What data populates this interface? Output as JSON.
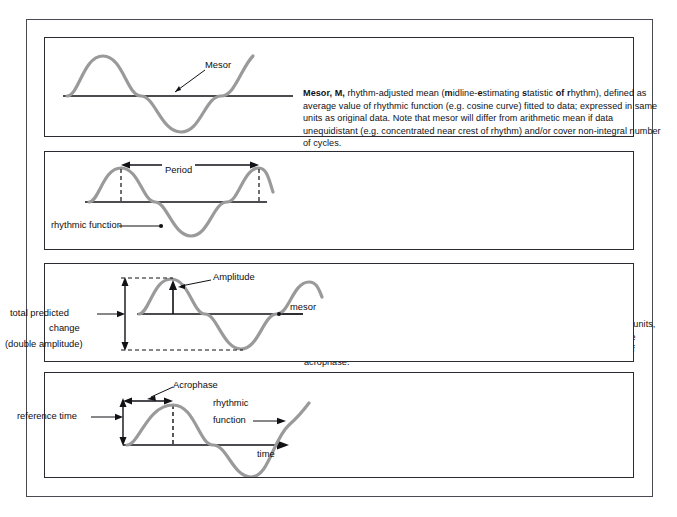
{
  "figure": {
    "colors": {
      "wave": "#9a9a9a",
      "axis": "#111116",
      "panel_border": "#2a2a30",
      "outer_border": "#4a4a52",
      "text": "#111116",
      "background": "#ffffff"
    }
  },
  "panels": [
    {
      "id": "mesor",
      "term": "Mesor, M,",
      "diagram_labels": [
        {
          "name": "mesor-callout",
          "text": "Mesor"
        }
      ],
      "text_runs": [
        {
          "bold": true,
          "text": "Mesor, M,"
        },
        {
          "bold": false,
          "text": " rhythm-adjusted mean ("
        },
        {
          "bold": true,
          "text": "m"
        },
        {
          "bold": false,
          "text": "idline-"
        },
        {
          "bold": true,
          "text": "e"
        },
        {
          "bold": false,
          "text": "stimating "
        },
        {
          "bold": true,
          "text": "s"
        },
        {
          "bold": false,
          "text": "tatistic "
        },
        {
          "bold": true,
          "text": "of"
        },
        {
          "bold": false,
          "text": " "
        },
        {
          "bold": true,
          "text": "r"
        },
        {
          "bold": false,
          "text": "hythm), defined as average value of rhythmic function (e.g. cosine curve) fitted to data; expressed in same units as original data. Note that mesor will differ from arithmetic mean if data unequidistant (e.g. concentrated near crest of rhythm) and/or cover non-integral number of cycles."
        }
      ]
    },
    {
      "id": "period",
      "term": "Period, τ,",
      "diagram_labels": [
        {
          "name": "period-callout",
          "text": "Period"
        },
        {
          "name": "rhythmic-function-callout",
          "text": "rhythmic function"
        }
      ],
      "text_runs": [
        {
          "bold": true,
          "text": "Period,"
        },
        {
          "bold": false,
          "text": " "
        },
        {
          "bold": true,
          "text": "τ,"
        },
        {
          "bold": false,
          "text": " duration of one complete cycle in rhythmic function; expressed in time units, such as seconds, hours, days or years, or in physiological units such as complete cardiac, respiratory or menstrual cycles; equated to 360°for angular expression of acrophase."
        }
      ]
    },
    {
      "id": "amplitude",
      "term": "Amplitude, A,",
      "diagram_labels": [
        {
          "name": "amplitude-callout",
          "text": "Amplitude"
        },
        {
          "name": "total-predicted-change-label-line1",
          "text": "total predicted"
        },
        {
          "name": "total-predicted-change-label-line2",
          "text": "change"
        },
        {
          "name": "double-amplitude-label",
          "text": "(double amplitude)"
        },
        {
          "name": "mesor-callout",
          "text": "mesor"
        }
      ],
      "text_runs": [
        {
          "bold": true,
          "text": "Amplitude, A,"
        },
        {
          "bold": false,
          "text": " half of total predictable change in rhythm, defined by rhythmic function fitted to data; expressed in original or ‘relative’ units, e.g. as percentage of series mean or mesor."
        }
      ]
    },
    {
      "id": "acrophase",
      "term": "Acrophase, ø,",
      "diagram_labels": [
        {
          "name": "acrophase-callout",
          "text": "Acrophase"
        },
        {
          "name": "reference-time-label",
          "text": "reference time"
        },
        {
          "name": "rhythmic-function-label-line1",
          "text": "rhythmic"
        },
        {
          "name": "rhythmic-function-label-line2",
          "text": "function"
        },
        {
          "name": "time-axis-label",
          "text": "time"
        }
      ],
      "text_runs": [
        {
          "bold": true,
          "text": "Acrophase, ø,"
        },
        {
          "bold": false,
          "text": " lag time from reference time of rhythm’s crest-time, defined by rhythmic function fitted to data; usually expressed in (negative) degrees, with 360°= period, 0°= reference time; customary time units (e.g. clock-hours and minutes, days, weeks, months or years) or physiological units (e.g. number of heart beats, respiratory or menstrual cycles) also appropriate for rhythm synchronized with corresponding period."
        }
      ]
    }
  ]
}
